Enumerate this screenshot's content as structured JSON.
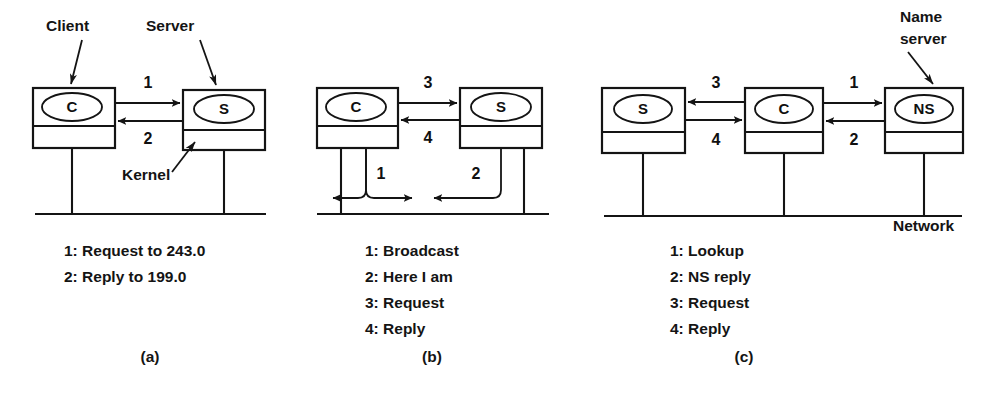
{
  "figure": {
    "background": "#ffffff",
    "ink": "#141414"
  },
  "panels": [
    {
      "id": "a",
      "label": "(a)",
      "annotations": [
        {
          "name": "client",
          "text": "Client"
        },
        {
          "name": "server",
          "text": "Server"
        },
        {
          "name": "kernel",
          "text": "Kernel"
        }
      ],
      "nodes": [
        {
          "name": "client-machine",
          "node_label": "C"
        },
        {
          "name": "server-machine",
          "node_label": "S"
        }
      ],
      "arrow_numbers": [
        "1",
        "2"
      ],
      "legend": [
        "1: Request to 243.0",
        "2: Reply to 199.0"
      ]
    },
    {
      "id": "b",
      "label": "(b)",
      "annotations": [],
      "nodes": [
        {
          "name": "client-machine",
          "node_label": "C"
        },
        {
          "name": "server-machine",
          "node_label": "S"
        }
      ],
      "arrow_numbers": [
        "1",
        "2",
        "3",
        "4"
      ],
      "legend": [
        "1: Broadcast",
        "2: Here I am",
        "3: Request",
        "4: Reply"
      ]
    },
    {
      "id": "c",
      "label": "(c)",
      "annotations": [
        {
          "name": "name-server-line1",
          "text": "Name"
        },
        {
          "name": "name-server-line2",
          "text": "server"
        },
        {
          "name": "network",
          "text": "Network"
        }
      ],
      "nodes": [
        {
          "name": "server-machine",
          "node_label": "S"
        },
        {
          "name": "client-machine",
          "node_label": "C"
        },
        {
          "name": "nameserver-machine",
          "node_label": "NS"
        }
      ],
      "arrow_numbers": [
        "1",
        "2",
        "3",
        "4"
      ],
      "legend": [
        "1: Lookup",
        "2: NS reply",
        "3: Request",
        "4: Reply"
      ]
    }
  ]
}
